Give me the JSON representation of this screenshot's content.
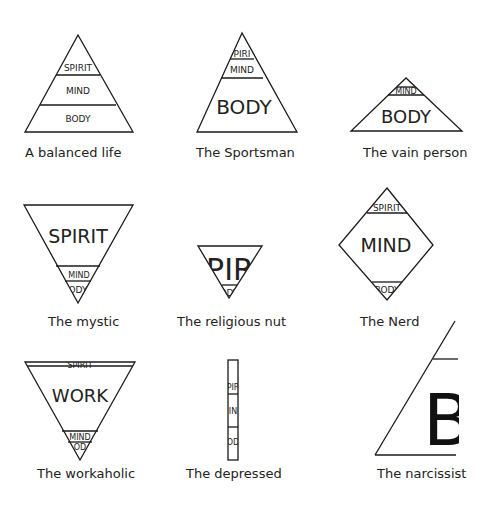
{
  "figures": [
    {
      "caption": "A balanced life",
      "layers": [
        "SPIRIT",
        "MIND",
        "BODY"
      ]
    },
    {
      "caption": "The Sportsman",
      "layers": [
        "PIRI",
        "MIND",
        "BODY"
      ]
    },
    {
      "caption": "The vain person",
      "layers": [
        "MIND",
        "BODY"
      ]
    },
    {
      "caption": "The mystic",
      "layers": [
        "SPIRIT",
        "MIND",
        "ODY"
      ]
    },
    {
      "caption": "The religious nut",
      "layers": [
        "PIR",
        "ODY"
      ]
    },
    {
      "caption": "The Nerd",
      "layers": [
        "SPIRIT",
        "MIND",
        "BODY"
      ]
    },
    {
      "caption": "The workaholic",
      "layers": [
        "SPIRIT",
        "WORK",
        "MIND",
        "OD"
      ]
    },
    {
      "caption": "The depressed",
      "layers": [
        "PIR",
        "IN",
        "OD"
      ]
    },
    {
      "caption": "The narcissist",
      "layers": [
        "B"
      ]
    }
  ]
}
